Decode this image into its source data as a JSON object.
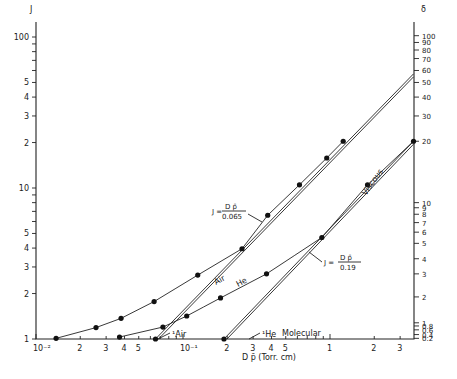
{
  "chart_data": {
    "type": "line",
    "title": "",
    "xlabel": "D p̄ (Torr.cm)",
    "ylabel": "J",
    "y2label": "δ",
    "xscale": "log",
    "yscale": "log",
    "xlim": [
      0.01,
      3.7
    ],
    "ylim": [
      1,
      125
    ],
    "grid": false,
    "x_tick_labels": [
      {
        "value": 0.01,
        "label": "10⁻²"
      },
      {
        "value": 0.02,
        "label": "2"
      },
      {
        "value": 0.03,
        "label": "3"
      },
      {
        "value": 0.04,
        "label": "4"
      },
      {
        "value": 0.05,
        "label": "5"
      },
      {
        "value": 0.1,
        "label": "10⁻¹"
      },
      {
        "value": 0.2,
        "label": "2"
      },
      {
        "value": 0.3,
        "label": "3"
      },
      {
        "value": 0.4,
        "label": "4"
      },
      {
        "value": 0.5,
        "label": "5"
      },
      {
        "value": 1,
        "label": "1"
      },
      {
        "value": 2,
        "label": "2"
      },
      {
        "value": 3,
        "label": "3"
      }
    ],
    "y_tick_labels": [
      {
        "value": 1,
        "label": "1"
      },
      {
        "value": 2,
        "label": "2"
      },
      {
        "value": 3,
        "label": "3"
      },
      {
        "value": 4,
        "label": "4"
      },
      {
        "value": 5,
        "label": "5"
      },
      {
        "value": 10,
        "label": "10"
      },
      {
        "value": 20,
        "label": "2"
      },
      {
        "value": 30,
        "label": "3"
      },
      {
        "value": 40,
        "label": "4"
      },
      {
        "value": 50,
        "label": "5"
      },
      {
        "value": 100,
        "label": "100"
      }
    ],
    "y2_tick_labels": [
      {
        "J": 1.01,
        "label": "0.2"
      },
      {
        "J": 1.07,
        "label": "0.4"
      },
      {
        "J": 1.15,
        "label": "0.6"
      },
      {
        "J": 1.22,
        "label": "0.8"
      },
      {
        "J": 1.28,
        "label": "1"
      },
      {
        "J": 1.9,
        "label": "2"
      },
      {
        "J": 2.7,
        "label": "3"
      },
      {
        "J": 3.4,
        "label": "4"
      },
      {
        "J": 4.3,
        "label": "5"
      },
      {
        "J": 5.1,
        "label": "6"
      },
      {
        "J": 5.9,
        "label": "7"
      },
      {
        "J": 6.7,
        "label": "8"
      },
      {
        "J": 7.4,
        "label": "9"
      },
      {
        "J": 8.0,
        "label": "10"
      },
      {
        "J": 20.4,
        "label": "20"
      },
      {
        "J": 30,
        "label": "30"
      },
      {
        "J": 40,
        "label": "40"
      },
      {
        "J": 50,
        "label": "50"
      },
      {
        "J": 60,
        "label": "60"
      },
      {
        "J": 72,
        "label": "70"
      },
      {
        "J": 82,
        "label": "80"
      },
      {
        "J": 92,
        "label": "90"
      },
      {
        "J": 102,
        "label": "100"
      }
    ],
    "series": [
      {
        "name": "Air",
        "kind": "measured",
        "x": [
          0.0137,
          0.0256,
          0.0379,
          0.0636,
          0.126,
          0.252,
          0.377,
          0.62,
          0.95,
          1.23
        ],
        "y": [
          1.01,
          1.19,
          1.37,
          1.77,
          2.65,
          3.96,
          6.6,
          10.5,
          15.8,
          20.4
        ]
      },
      {
        "name": "He",
        "kind": "measured",
        "x": [
          0.037,
          0.073,
          0.106,
          0.18,
          0.37,
          0.88,
          1.8,
          3.7
        ],
        "y": [
          1.03,
          1.2,
          1.42,
          1.87,
          2.7,
          4.7,
          10.5,
          20.4
        ]
      },
      {
        "name": "J = D p̄ / 0.065",
        "kind": "viscous-asymptote-air",
        "x": [
          0.065,
          3.7
        ],
        "y": [
          1,
          57
        ]
      },
      {
        "name": "J = D p̄ / 0.19",
        "kind": "viscous-asymptote-he",
        "x": [
          0.19,
          3.7
        ],
        "y": [
          1,
          20.4
        ]
      }
    ],
    "annotations": [
      {
        "text": "Air",
        "near": "Air curve"
      },
      {
        "text": "He",
        "near": "He curve"
      },
      {
        "text": "Viscous",
        "near": "He asymptote"
      },
      {
        "text": "Molecular",
        "near": "bottom axis"
      },
      {
        "text": "¹Air",
        "x": 0.065
      },
      {
        "text": "¹He",
        "x": 0.19
      },
      {
        "text": "J = D p̄ / 0.065",
        "near": "Air asymptote"
      },
      {
        "text": "J = D p̄ / 0.19",
        "near": "He asymptote"
      }
    ]
  },
  "labels": {
    "y_axis": "J",
    "y2_axis": "δ",
    "x_axis": "D  p̄  (Torr. cm)",
    "air": "Air",
    "he": "He",
    "viscous": "Viscous",
    "molecular": "Molecular",
    "air_marker": "¹Air",
    "he_marker": "¹He",
    "eq1_lhs": "J =",
    "eq1_num": "D  p̄",
    "eq1_den": "0.065",
    "eq2_lhs": "J =",
    "eq2_num": "D  p̄",
    "eq2_den": "0.19"
  }
}
